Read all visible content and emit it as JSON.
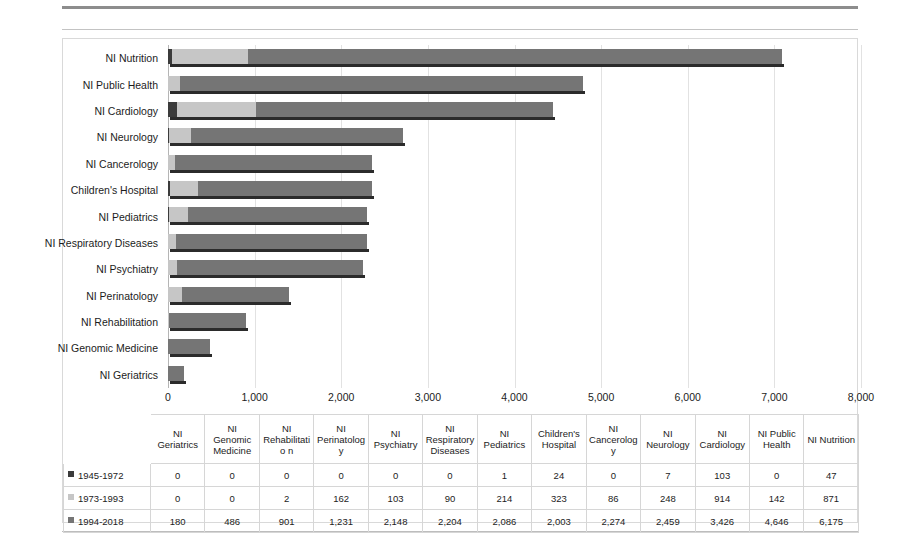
{
  "chart_data": {
    "type": "bar",
    "orientation": "horizontal",
    "stacked": true,
    "title": "",
    "xlabel": "",
    "ylabel": "",
    "xlim": [
      0,
      8000
    ],
    "xticks": [
      "0",
      "1,000",
      "2,000",
      "3,000",
      "4,000",
      "5,000",
      "6,000",
      "7,000",
      "8,000"
    ],
    "xtick_values": [
      0,
      1000,
      2000,
      3000,
      4000,
      5000,
      6000,
      7000,
      8000
    ],
    "grid": true,
    "legend_position": "table-row-headers",
    "categories_chart_order": [
      "NI Nutrition",
      "NI Public Health",
      "NI Cardiology",
      "NI Neurology",
      "NI Cancerology",
      "Children's Hospital",
      "NI Pediatrics",
      "NI Respiratory Diseases",
      "NI Psychiatry",
      "NI Perinatology",
      "NI Rehabilitation",
      "NI Genomic Medicine",
      "NI Geriatrics"
    ],
    "categories": [
      "NI Geriatrics",
      "NI Genomic Medicine",
      "NI Rehabilitation",
      "NI Perinatology",
      "NI Psychiatry",
      "NI Respiratory Diseases",
      "NI Pediatrics",
      "Children's Hospital",
      "NI Cancerology",
      "NI Neurology",
      "NI Cardiology",
      "NI Public Health",
      "NI Nutrition"
    ],
    "series": [
      {
        "name": "1945-1972",
        "color": "#3b3b3b",
        "values": [
          0,
          0,
          0,
          0,
          0,
          0,
          1,
          24,
          0,
          7,
          103,
          0,
          47
        ]
      },
      {
        "name": "1973-1993",
        "color": "#c6c6c6",
        "values": [
          0,
          0,
          2,
          162,
          103,
          90,
          214,
          323,
          86,
          248,
          914,
          142,
          871
        ]
      },
      {
        "name": "1994-2018",
        "color": "#757575",
        "values": [
          180,
          486,
          901,
          1231,
          2148,
          2204,
          2086,
          2003,
          2274,
          2459,
          3426,
          4646,
          6175
        ]
      }
    ]
  },
  "table": {
    "corner_label": "",
    "headers": [
      "NI Geriatrics",
      "NI Genomic Medicine",
      "NI Rehabilitatio n",
      "NI Perinatology",
      "NI Psychiatry",
      "NI Respiratory Diseases",
      "NI Pediatrics",
      "Children's Hospital",
      "NI Cancerology",
      "NI Neurology",
      "NI Cardiology",
      "NI Public Health",
      "NI Nutrition"
    ],
    "rows": [
      {
        "label": "1945-1972",
        "swatch": "sw1",
        "cells": [
          "0",
          "0",
          "0",
          "0",
          "0",
          "0",
          "1",
          "24",
          "0",
          "7",
          "103",
          "0",
          "47"
        ]
      },
      {
        "label": "1973-1993",
        "swatch": "sw2",
        "cells": [
          "0",
          "0",
          "2",
          "162",
          "103",
          "90",
          "214",
          "323",
          "86",
          "248",
          "914",
          "142",
          "871"
        ]
      },
      {
        "label": "1994-2018",
        "swatch": "sw3",
        "cells": [
          "180",
          "486",
          "901",
          "1,231",
          "2,148",
          "2,204",
          "2,086",
          "2,003",
          "2,274",
          "2,459",
          "3,426",
          "4,646",
          "6,175"
        ]
      }
    ]
  }
}
